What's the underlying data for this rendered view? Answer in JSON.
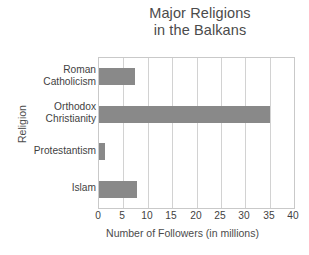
{
  "chart_data": {
    "type": "bar",
    "orientation": "horizontal",
    "title": "Major Religions\nin the Balkans",
    "title_line1": "Major Religions",
    "title_line2": "in the Balkans",
    "xlabel": "Number of Followers (in millions)",
    "ylabel": "Religion",
    "categories": [
      "Roman\nCatholicism",
      "Orthodox\nChristianity",
      "Protestantism",
      "Islam"
    ],
    "values": [
      7.3,
      35,
      1.3,
      7.8
    ],
    "xlim": [
      0,
      40
    ],
    "xticks": [
      0,
      5,
      10,
      15,
      20,
      25,
      30,
      35,
      40
    ],
    "xtick_labels": [
      "0",
      "5",
      "10",
      "15",
      "20",
      "25",
      "30",
      "35",
      "40"
    ],
    "grid": "vertical",
    "legend": "none",
    "bar_color": "#898989",
    "grid_color": "#d2d2d2",
    "frame_color": "#c9c9c9",
    "background_color": "#ffffff",
    "text_color": "#3f3f3f"
  }
}
